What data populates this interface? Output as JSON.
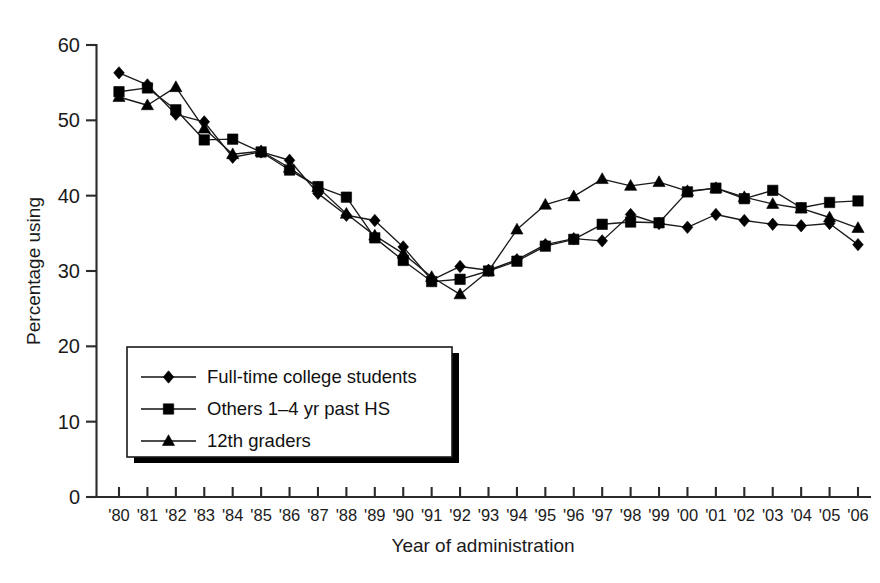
{
  "chart_data": {
    "type": "line",
    "title": "",
    "xlabel": "Year of administration",
    "ylabel": "Percentage using",
    "xlim": [
      1980,
      2006
    ],
    "ylim": [
      0,
      60
    ],
    "ytick_values": [
      0,
      10,
      20,
      30,
      40,
      50,
      60
    ],
    "ytick_labels": [
      "0",
      "10",
      "20",
      "30",
      "40",
      "50",
      "60"
    ],
    "grid": false,
    "legend_position": "lower-left-inside",
    "x": [
      1980,
      1981,
      1982,
      1983,
      1984,
      1985,
      1986,
      1987,
      1988,
      1989,
      1990,
      1991,
      1992,
      1993,
      1994,
      1995,
      1996,
      1997,
      1998,
      1999,
      2000,
      2001,
      2002,
      2003,
      2004,
      2005,
      2006
    ],
    "categories": [
      "'80",
      "'81",
      "'82",
      "'83",
      "'84",
      "'85",
      "'86",
      "'87",
      "'88",
      "'89",
      "'90",
      "'91",
      "'92",
      "'93",
      "'94",
      "'95",
      "'96",
      "'97",
      "'98",
      "'99",
      "'00",
      "'01",
      "'02",
      "'03",
      "'04",
      "'05",
      "'06"
    ],
    "series": [
      {
        "name": "Full-time college students",
        "marker": "diamond",
        "values": [
          56.3,
          54.7,
          50.8,
          49.8,
          45.1,
          45.8,
          44.7,
          40.3,
          37.4,
          36.7,
          33.2,
          28.8,
          30.6,
          30.1,
          31.5,
          33.5,
          34.3,
          34.0,
          37.5,
          36.3,
          35.8,
          37.5,
          36.7,
          36.2,
          36.0,
          36.3,
          33.5
        ]
      },
      {
        "name": "Others 1–4 yr past HS",
        "marker": "square",
        "values": [
          53.8,
          54.3,
          51.4,
          47.4,
          47.5,
          45.8,
          43.4,
          41.2,
          39.8,
          34.4,
          31.4,
          28.6,
          28.9,
          30.0,
          31.3,
          33.3,
          34.2,
          36.2,
          36.5,
          36.4,
          40.5,
          41.0,
          39.6,
          40.7,
          38.4,
          39.1,
          39.3
        ]
      },
      {
        "name": "12th graders",
        "marker": "triangle",
        "values": [
          53.1,
          52.0,
          54.4,
          48.9,
          45.5,
          45.9,
          43.7,
          41.1,
          37.6,
          34.7,
          32.3,
          29.2,
          26.9,
          30.0,
          35.5,
          38.8,
          39.9,
          42.2,
          41.3,
          41.8,
          40.6,
          41.0,
          39.8,
          38.9,
          38.3,
          37.1,
          35.7
        ]
      }
    ]
  },
  "legend": {
    "entries": [
      {
        "label": "Full-time college students",
        "marker": "diamond"
      },
      {
        "label": "Others 1–4 yr past HS",
        "marker": "square"
      },
      {
        "label": "12th graders",
        "marker": "triangle"
      }
    ]
  },
  "axes": {
    "x_title": "Year of administration",
    "y_title": "Percentage using"
  }
}
